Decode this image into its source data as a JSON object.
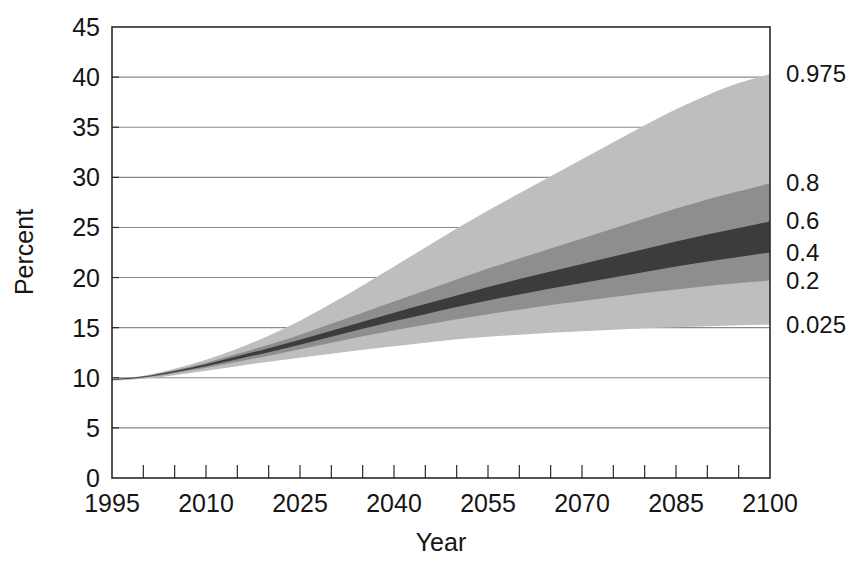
{
  "chart_data": {
    "type": "area",
    "title": "",
    "subtitle": "",
    "xlabel": "Year",
    "ylabel": "Percent",
    "xlim": [
      1995,
      2100
    ],
    "ylim": [
      0,
      45
    ],
    "grid": true,
    "legend_position": "right-edge-labels",
    "x_major_ticks": [
      1995,
      2010,
      2025,
      2040,
      2055,
      2070,
      2085,
      2100
    ],
    "x_minor_tick_step": 5,
    "y_ticks": [
      0,
      5,
      10,
      15,
      20,
      25,
      30,
      35,
      40,
      45
    ],
    "x_tick_labels": [
      "1995",
      "2010",
      "2025",
      "2040",
      "2055",
      "2070",
      "2085",
      "2100"
    ],
    "y_tick_labels": [
      "0",
      "5",
      "10",
      "15",
      "20",
      "25",
      "30",
      "35",
      "40",
      "45"
    ],
    "x": [
      1995,
      2000,
      2005,
      2010,
      2015,
      2020,
      2025,
      2030,
      2035,
      2040,
      2045,
      2050,
      2055,
      2060,
      2065,
      2070,
      2075,
      2080,
      2085,
      2090,
      2095,
      2100
    ],
    "series": [
      {
        "name": "0.975",
        "percentile": 0.975,
        "edge_label": "0.975",
        "values": [
          9.85,
          10.2,
          10.9,
          11.8,
          12.9,
          14.2,
          15.7,
          17.4,
          19.2,
          21.1,
          23.0,
          24.9,
          26.7,
          28.4,
          30.1,
          31.8,
          33.5,
          35.2,
          36.8,
          38.2,
          39.4,
          40.3
        ]
      },
      {
        "name": "0.8",
        "percentile": 0.8,
        "edge_label": "0.8",
        "values": [
          9.85,
          10.15,
          10.75,
          11.5,
          12.4,
          13.3,
          14.3,
          15.4,
          16.5,
          17.6,
          18.7,
          19.8,
          20.9,
          21.9,
          22.9,
          23.9,
          24.9,
          25.9,
          26.9,
          27.8,
          28.6,
          29.4
        ]
      },
      {
        "name": "0.6",
        "percentile": 0.6,
        "edge_label": "0.6",
        "values": [
          9.85,
          10.12,
          10.68,
          11.35,
          12.15,
          12.95,
          13.8,
          14.7,
          15.6,
          16.5,
          17.35,
          18.2,
          19.05,
          19.85,
          20.6,
          21.35,
          22.1,
          22.85,
          23.6,
          24.3,
          24.95,
          25.6
        ]
      },
      {
        "name": "median",
        "percentile": 0.5,
        "edge_label": "",
        "values": [
          9.8,
          10.1,
          10.62,
          11.25,
          12.0,
          12.75,
          13.55,
          14.4,
          15.25,
          16.05,
          16.85,
          17.6,
          18.35,
          19.05,
          19.75,
          20.4,
          21.05,
          21.7,
          22.35,
          22.95,
          23.5,
          24.05
        ]
      },
      {
        "name": "0.4",
        "percentile": 0.4,
        "edge_label": "0.4",
        "values": [
          9.78,
          10.05,
          10.56,
          11.15,
          11.85,
          12.55,
          13.3,
          14.1,
          14.9,
          15.65,
          16.35,
          17.05,
          17.7,
          18.3,
          18.9,
          19.45,
          20.0,
          20.55,
          21.1,
          21.6,
          22.05,
          22.5
        ]
      },
      {
        "name": "0.2",
        "percentile": 0.2,
        "edge_label": "0.2",
        "values": [
          9.75,
          10.0,
          10.45,
          11.0,
          11.6,
          12.2,
          12.85,
          13.5,
          14.15,
          14.75,
          15.3,
          15.85,
          16.35,
          16.8,
          17.25,
          17.65,
          18.05,
          18.45,
          18.8,
          19.15,
          19.45,
          19.7
        ]
      },
      {
        "name": "0.025",
        "percentile": 0.025,
        "edge_label": "0.025",
        "values": [
          9.7,
          9.9,
          10.25,
          10.7,
          11.15,
          11.6,
          12.0,
          12.4,
          12.8,
          13.15,
          13.5,
          13.85,
          14.1,
          14.3,
          14.5,
          14.65,
          14.8,
          14.95,
          15.05,
          15.15,
          15.25,
          15.3
        ]
      }
    ],
    "bands": [
      {
        "name": "95% interval",
        "lower": "0.025",
        "upper": "0.975",
        "color": "#bebebe"
      },
      {
        "name": "60% interval",
        "lower": "0.2",
        "upper": "0.8",
        "color": "#8e8e8e"
      },
      {
        "name": "20% interval",
        "lower": "0.4",
        "upper": "0.6",
        "color": "#3c3c3c"
      }
    ],
    "edge_labels": [
      {
        "text": "0.975",
        "value": 40.3
      },
      {
        "text": "0.8",
        "value": 29.4
      },
      {
        "text": "0.6",
        "value": 25.6
      },
      {
        "text": "0.4",
        "value": 22.5
      },
      {
        "text": "0.2",
        "value": 19.7
      },
      {
        "text": "0.025",
        "value": 15.3
      }
    ],
    "colors": {
      "band_light": "#bebebe",
      "band_medium": "#8e8e8e",
      "band_dark": "#3c3c3c",
      "axis": "#2a2a2a",
      "grid": "#8a8a8a",
      "text": "#151515",
      "background": "#ffffff"
    }
  }
}
